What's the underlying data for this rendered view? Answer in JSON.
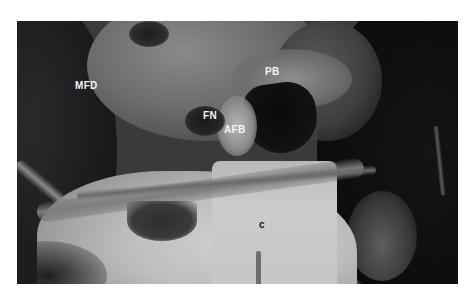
{
  "figure": {
    "type": "grayscale surgical photograph",
    "labels": [
      {
        "id": "mfd",
        "text": "MFD",
        "x": 75,
        "y": 81,
        "tone": "light"
      },
      {
        "id": "pb",
        "text": "PB",
        "x": 265,
        "y": 67,
        "tone": "light"
      },
      {
        "id": "fn",
        "text": "FN",
        "x": 203,
        "y": 111,
        "tone": "light"
      },
      {
        "id": "afb",
        "text": "AFB",
        "x": 224,
        "y": 125,
        "tone": "light"
      },
      {
        "id": "c",
        "text": "c",
        "x": 259,
        "y": 220,
        "tone": "dark"
      }
    ],
    "colors": {
      "background": "#ffffff",
      "photo_base": "#3a3a3a",
      "label_light": "#f4f4f4",
      "label_dark": "#111111"
    }
  }
}
